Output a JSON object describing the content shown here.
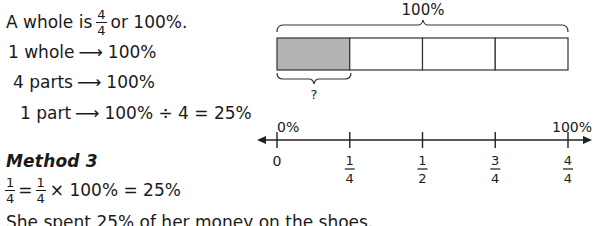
{
  "left": {
    "intro": {
      "prefix": "A whole is",
      "frac_num": "4",
      "frac_den": "4",
      "suffix": "or 100%."
    },
    "rows": [
      {
        "left": "1 whole",
        "arrow": "⟶",
        "right": "100%"
      },
      {
        "left": "4 parts",
        "arrow": "⟶",
        "right": "100%"
      },
      {
        "left": "1 part",
        "arrow": "⟶",
        "right": "100% ÷ 4 = 25%"
      }
    ],
    "method_heading": "Method 3",
    "equation": {
      "frac1_num": "1",
      "frac1_den": "4",
      "eq1": "=",
      "frac2_num": "1",
      "frac2_den": "4",
      "rest": "× 100% = 25%"
    },
    "conclusion": "She spent 25% of her money on the shoes."
  },
  "bar_model": {
    "top_label": "100%",
    "parts": 4,
    "shaded_parts": 1,
    "shaded_color": "#b3b3b3",
    "bottom_label": "?"
  },
  "number_line": {
    "top_labels": {
      "start": "0%",
      "end": "100%"
    },
    "ticks": [
      {
        "whole": "0"
      },
      {
        "num": "1",
        "den": "4"
      },
      {
        "num": "1",
        "den": "2"
      },
      {
        "num": "3",
        "den": "4"
      },
      {
        "num": "4",
        "den": "4"
      }
    ]
  }
}
